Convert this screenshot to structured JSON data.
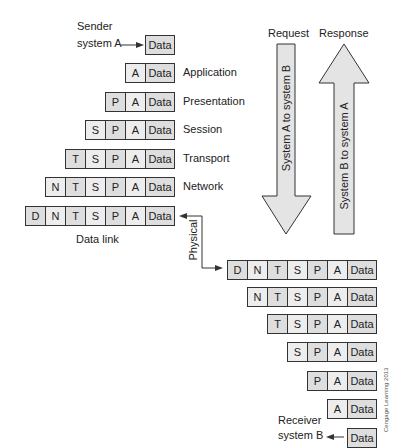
{
  "sender": {
    "line1": "Sender",
    "line2": "system A"
  },
  "receiver": {
    "line1": "Receiver",
    "line2": "system B"
  },
  "headers": {
    "A": "A",
    "P": "P",
    "S": "S",
    "T": "T",
    "N": "N",
    "D": "D",
    "Data": "Data"
  },
  "layers_down": [
    {
      "label": "Application"
    },
    {
      "label": "Presentation"
    },
    {
      "label": "Session"
    },
    {
      "label": "Transport"
    },
    {
      "label": "Network"
    },
    {
      "label": "Data link"
    }
  ],
  "physical_label": "Physical",
  "arrows": {
    "request": {
      "title": "Request",
      "text": "System A to system B"
    },
    "response": {
      "title": "Response",
      "text": "System B to system A"
    }
  },
  "credit": "Cengage Learning 2013",
  "colors": {
    "cell_dark": "#dedede",
    "cell_light": "#ededed",
    "arrow_fill": "#e4e4e4",
    "stroke": "#333333"
  }
}
